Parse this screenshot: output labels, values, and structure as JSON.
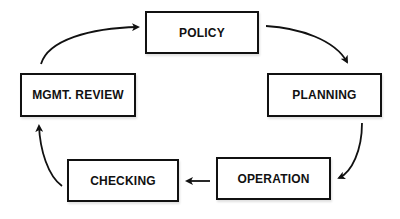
{
  "diagram": {
    "type": "cycle",
    "nodes": [
      {
        "id": "policy",
        "label": "POLICY"
      },
      {
        "id": "planning",
        "label": "PLANNING"
      },
      {
        "id": "operation",
        "label": "OPERATION"
      },
      {
        "id": "checking",
        "label": "CHECKING"
      },
      {
        "id": "mgmt_review",
        "label": "MGMT. REVIEW"
      }
    ],
    "edges": [
      {
        "from": "policy",
        "to": "planning"
      },
      {
        "from": "planning",
        "to": "operation"
      },
      {
        "from": "operation",
        "to": "checking"
      },
      {
        "from": "checking",
        "to": "mgmt_review"
      },
      {
        "from": "mgmt_review",
        "to": "policy"
      }
    ],
    "colors": {
      "stroke": "#111111",
      "background": "#ffffff"
    }
  }
}
